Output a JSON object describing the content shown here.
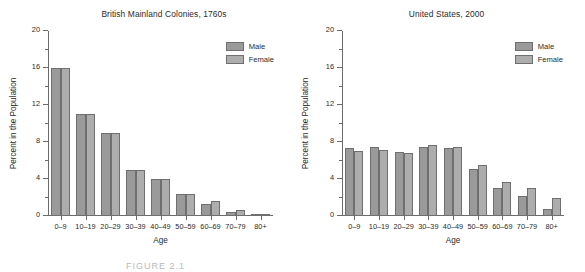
{
  "figure": {
    "caption": "FIGURE 2.1"
  },
  "legend": {
    "male_label": "Male",
    "female_label": "Female",
    "male_color": "#9a9a9a",
    "female_color": "#adadad"
  },
  "axis": {
    "xlabel": "Age",
    "ylabel": "Percent in the Population",
    "yticks": [
      "0",
      "4",
      "8",
      "12",
      "16",
      "20"
    ],
    "ytick_values": [
      0,
      4,
      8,
      12,
      16,
      20
    ]
  },
  "chart_data": [
    {
      "type": "bar",
      "title": "British Mainland Colonies, 1760s",
      "xlabel": "Age",
      "ylabel": "Percent in the Population",
      "ylim": [
        0,
        20
      ],
      "grid": false,
      "legend_position": "top-right",
      "categories": [
        "0–9",
        "10–19",
        "20–29",
        "30–39",
        "40–49",
        "50–59",
        "60–69",
        "70–79",
        "80+"
      ],
      "series": [
        {
          "name": "Male",
          "values": [
            16.0,
            11.0,
            9.0,
            5.0,
            4.0,
            2.4,
            1.3,
            0.45,
            0.1
          ]
        },
        {
          "name": "Female",
          "values": [
            16.0,
            11.0,
            9.0,
            5.0,
            4.0,
            2.4,
            1.6,
            0.7,
            0.15
          ]
        }
      ]
    },
    {
      "type": "bar",
      "title": "United States, 2000",
      "xlabel": "Age",
      "ylabel": "Percent in the Population",
      "ylim": [
        0,
        20
      ],
      "grid": false,
      "legend_position": "top-right",
      "categories": [
        "0–9",
        "10–19",
        "20–29",
        "30–39",
        "40–49",
        "50–59",
        "60–69",
        "70–79",
        "80+"
      ],
      "series": [
        {
          "name": "Male",
          "values": [
            7.3,
            7.5,
            6.9,
            7.5,
            7.4,
            5.1,
            3.0,
            2.2,
            0.8
          ]
        },
        {
          "name": "Female",
          "values": [
            7.0,
            7.1,
            6.8,
            7.7,
            7.5,
            5.5,
            3.7,
            3.0,
            2.0
          ]
        }
      ]
    }
  ]
}
